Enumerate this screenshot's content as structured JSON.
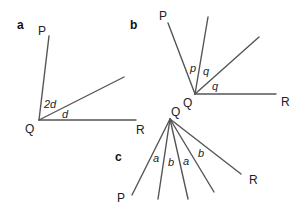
{
  "diagrams": [
    {
      "label": "a",
      "vertex_label": "Q",
      "labels": {
        "P": "P",
        "R": "R"
      },
      "angles": [
        "2d",
        "d"
      ]
    },
    {
      "label": "b",
      "vertex_label": "Q",
      "labels": {
        "P": "P",
        "R": "R"
      },
      "angles": [
        "p",
        "q",
        "q"
      ]
    },
    {
      "label": "c",
      "vertex_label": "Q",
      "labels": {
        "P": "P",
        "R": "R"
      },
      "angles": [
        "a",
        "b",
        "a",
        "b"
      ]
    }
  ],
  "colors": {
    "line": "#555555",
    "text": "#222222"
  }
}
